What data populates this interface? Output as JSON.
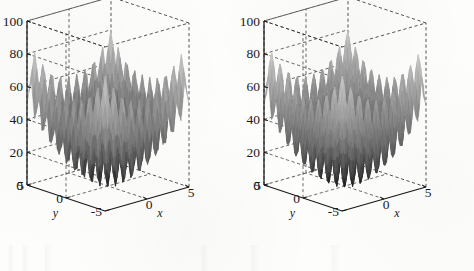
{
  "figure": {
    "background_color": "#fdfdfc",
    "ink_color": "#1a1a1a",
    "panel_count": 2
  },
  "chart_data": [
    {
      "type": "surface",
      "panel": "left",
      "title": "",
      "xlabel": "x",
      "ylabel": "y",
      "zlabel": "z",
      "xlim": [
        -5,
        5
      ],
      "ylim": [
        -5,
        5
      ],
      "zlim": [
        0,
        100
      ],
      "xticks": [
        0,
        5
      ],
      "xticklabels": [
        "0",
        "5"
      ],
      "yticks": [
        -5,
        0,
        5
      ],
      "yticklabels": [
        "-5",
        "0",
        "5"
      ],
      "zticks": [
        0,
        20,
        40,
        60,
        80,
        100
      ],
      "zticklabels": [
        "0",
        "20",
        "40",
        "60",
        "80",
        "100"
      ],
      "grid": true,
      "grid_style": "dashed",
      "box": true,
      "colormap": "gray",
      "shading": "interp",
      "function": "rastrigin",
      "mesh_resolution": 42,
      "amplitude": 10,
      "frequency": 2,
      "peak_value": 100,
      "view_azimuth": -37.5,
      "view_elevation": 30,
      "legend": false
    },
    {
      "type": "surface",
      "panel": "right",
      "title": "",
      "xlabel": "x",
      "ylabel": "y",
      "zlabel": "z",
      "xlim": [
        -5,
        5
      ],
      "ylim": [
        -5,
        5
      ],
      "zlim": [
        0,
        100
      ],
      "xticks": [
        0,
        5
      ],
      "xticklabels": [
        "0",
        "5"
      ],
      "yticks": [
        -5,
        0,
        5
      ],
      "yticklabels": [
        "-5",
        "0",
        "5"
      ],
      "zticks": [
        0,
        20,
        40,
        60,
        80,
        100
      ],
      "zticklabels": [
        "0",
        "20",
        "40",
        "60",
        "80",
        "100"
      ],
      "grid": true,
      "grid_style": "dashed",
      "box": true,
      "colormap": "gray",
      "shading": "interp",
      "function": "rastrigin",
      "mesh_resolution": 62,
      "amplitude": 10,
      "frequency": 2,
      "peak_value": 100,
      "view_azimuth": -37.5,
      "view_elevation": 30,
      "legend": false
    }
  ]
}
